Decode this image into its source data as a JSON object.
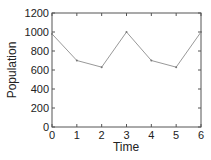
{
  "chart_data": {
    "type": "line",
    "title": "",
    "xlabel": "Time",
    "ylabel": "Population",
    "x": [
      0,
      1,
      2,
      3,
      4,
      5,
      6
    ],
    "series": [
      {
        "name": "Population",
        "values": [
          980,
          700,
          630,
          1000,
          700,
          630,
          1000
        ]
      }
    ],
    "xlim": [
      0,
      6
    ],
    "ylim": [
      0,
      1200
    ],
    "xticks": [
      "0",
      "1",
      "2",
      "3",
      "4",
      "5",
      "6"
    ],
    "yticks": [
      "0",
      "200",
      "400",
      "600",
      "800",
      "1000",
      "1200"
    ],
    "grid": false,
    "legend": "none"
  },
  "colors": {
    "line": "#999999",
    "axis": "#555555"
  }
}
